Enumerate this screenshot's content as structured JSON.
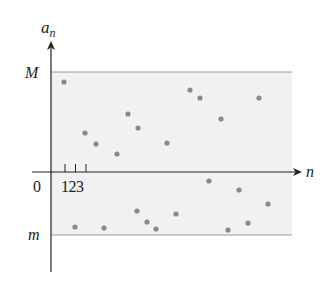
{
  "chart_data": {
    "type": "scatter",
    "title": "",
    "xlabel": "n",
    "ylabel": "a_n",
    "ylabel_main": "a",
    "ylabel_sub": "n",
    "origin_label": "0",
    "x_tick_labels": [
      "1",
      "2",
      "3"
    ],
    "x_tick_text": "123",
    "bound_labels": {
      "upper": "M",
      "lower": "m"
    },
    "bounds": {
      "upper": 1.0,
      "lower": -0.6
    },
    "shaded_band": "between m and M",
    "grid": false,
    "legend": null,
    "points": [
      {
        "n": 1,
        "a": 0.9
      },
      {
        "n": 3,
        "a": 0.38
      },
      {
        "n": 4,
        "a": 0.27
      },
      {
        "n": 6,
        "a": 0.17
      },
      {
        "n": 7,
        "a": 0.57
      },
      {
        "n": 8,
        "a": 0.43
      },
      {
        "n": 11,
        "a": 0.28
      },
      {
        "n": 13,
        "a": 0.81
      },
      {
        "n": 14,
        "a": 0.73
      },
      {
        "n": 16,
        "a": 0.52
      },
      {
        "n": 20,
        "a": 0.73
      },
      {
        "n": 2,
        "a": -0.54
      },
      {
        "n": 5,
        "a": -0.55
      },
      {
        "n": 8.2,
        "a": -0.38
      },
      {
        "n": 9,
        "a": -0.49
      },
      {
        "n": 10,
        "a": -0.56
      },
      {
        "n": 12,
        "a": -0.41
      },
      {
        "n": 15,
        "a": -0.09
      },
      {
        "n": 17,
        "a": -0.57
      },
      {
        "n": 18,
        "a": -0.17
      },
      {
        "n": 19,
        "a": -0.5
      },
      {
        "n": 21,
        "a": -0.31
      }
    ]
  },
  "plot": {
    "colors": {
      "band": "#f1f1f1",
      "bound_line": "#9a9a9a",
      "axis": "#222222",
      "point": "#8a8a8a"
    },
    "pixel_points": [
      [
        64,
        82
      ],
      [
        85,
        133
      ],
      [
        96,
        144
      ],
      [
        117,
        154
      ],
      [
        128,
        114
      ],
      [
        138,
        128
      ],
      [
        167,
        143
      ],
      [
        190,
        90
      ],
      [
        200,
        98
      ],
      [
        221,
        119
      ],
      [
        259,
        98
      ],
      [
        75,
        227
      ],
      [
        104,
        228
      ],
      [
        137,
        211
      ],
      [
        147,
        222
      ],
      [
        156,
        229
      ],
      [
        176,
        214
      ],
      [
        209,
        181
      ],
      [
        228,
        230
      ],
      [
        239,
        190
      ],
      [
        248,
        223
      ],
      [
        268,
        204
      ]
    ]
  }
}
